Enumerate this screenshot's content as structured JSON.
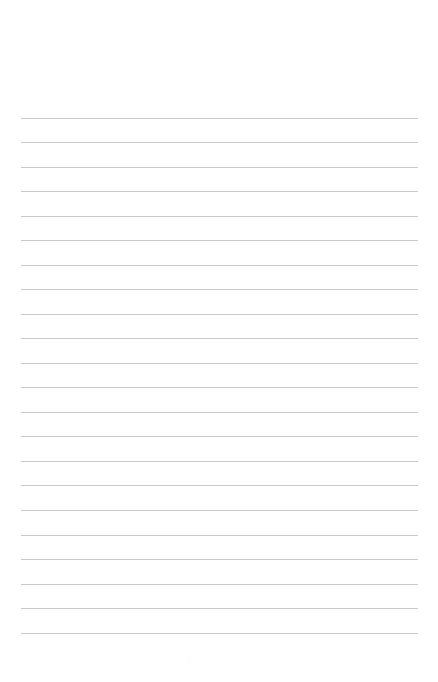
{
  "page": {
    "name": "lined-paper-sheet",
    "width": 438,
    "height": 682,
    "background_color": "#ffffff",
    "orientation": "portrait"
  },
  "ruling": {
    "style": "horizontal-ruled",
    "line_color": "#c9c9ce",
    "line_thickness_px": 1,
    "line_count": 22,
    "line_left_px": 21,
    "line_right_px": 418,
    "line_width_px": 397,
    "first_line_y_px": 118,
    "line_spacing_px": 24.5,
    "last_line_y_px": 633,
    "top_margin_px": 118,
    "bottom_margin_px": 46,
    "left_margin_px": 21,
    "right_margin_px": 20,
    "has_vertical_margin_rule": false,
    "has_header_text": false,
    "has_body_text": false,
    "lines": [
      {
        "index": 1,
        "y": 118
      },
      {
        "index": 2,
        "y": 142
      },
      {
        "index": 3,
        "y": 167
      },
      {
        "index": 4,
        "y": 191
      },
      {
        "index": 5,
        "y": 216
      },
      {
        "index": 6,
        "y": 240
      },
      {
        "index": 7,
        "y": 265
      },
      {
        "index": 8,
        "y": 289
      },
      {
        "index": 9,
        "y": 314
      },
      {
        "index": 10,
        "y": 338
      },
      {
        "index": 11,
        "y": 363
      },
      {
        "index": 12,
        "y": 387
      },
      {
        "index": 13,
        "y": 412
      },
      {
        "index": 14,
        "y": 436
      },
      {
        "index": 15,
        "y": 461
      },
      {
        "index": 16,
        "y": 485
      },
      {
        "index": 17,
        "y": 510
      },
      {
        "index": 18,
        "y": 535
      },
      {
        "index": 19,
        "y": 559
      },
      {
        "index": 20,
        "y": 584
      },
      {
        "index": 21,
        "y": 608
      },
      {
        "index": 22,
        "y": 633
      }
    ]
  },
  "artifacts": {
    "faint_mark": {
      "name": "faint-mark",
      "x": 187,
      "y": 657,
      "width": 5,
      "height": 8,
      "color": "#fdfdfd"
    }
  }
}
